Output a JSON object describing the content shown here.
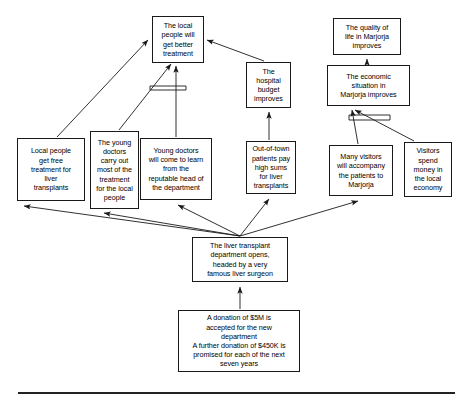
{
  "diagram": {
    "type": "causal-map",
    "baseline_rule": true,
    "nodes": [
      {
        "id": "local-people-better-treatment",
        "name": "node-local-people-better-treatment",
        "text": "The local\npeople will\nget better\ntreatment",
        "x": 152,
        "y": 16,
        "w": 52,
        "h": 47
      },
      {
        "id": "hospital-budget-improves",
        "name": "node-hospital-budget-improves",
        "text": "The\nhospital\nbudget\nimproves",
        "x": 246,
        "y": 62,
        "w": 45,
        "h": 46
      },
      {
        "id": "quality-of-life-marjorja",
        "name": "node-quality-of-life-marjorja",
        "text": "The quality of\nlife in Marjorja\nimproves",
        "x": 333,
        "y": 18,
        "w": 68,
        "h": 37
      },
      {
        "id": "economic-situation-marjorja",
        "name": "node-economic-situation-marjorja",
        "text": "The economic\nsituation in\nMarjorja improves",
        "x": 327,
        "y": 65,
        "w": 83,
        "h": 41
      },
      {
        "id": "local-people-free-treatment",
        "name": "node-local-people-free-treatment",
        "text": "Local people\nget free\ntreatment for\nliver\ntransplants",
        "x": 17,
        "y": 138,
        "w": 68,
        "h": 63
      },
      {
        "id": "young-doctors-carry-out",
        "name": "node-young-doctors-carry-out",
        "text": "The young\ndoctors\ncarry out\nmost of the\ntreatment\nfor the local\npeople",
        "x": 90,
        "y": 131,
        "w": 49,
        "h": 78
      },
      {
        "id": "young-doctors-come-learn",
        "name": "node-young-doctors-come-learn",
        "text": "Young doctors\nwill come to learn\nfrom the\nreputable head of\nthe department",
        "x": 140,
        "y": 138,
        "w": 72,
        "h": 62
      },
      {
        "id": "out-of-town-patients-pay",
        "name": "node-out-of-town-patients-pay",
        "text": "Out-of-town\npatients pay\nhigh sums\nfor liver\ntransplants",
        "x": 246,
        "y": 141,
        "w": 50,
        "h": 53
      },
      {
        "id": "many-visitors-accompany",
        "name": "node-many-visitors-accompany",
        "text": "Many visitors\nwill accompany\nthe patients to\nMarjorja",
        "x": 329,
        "y": 145,
        "w": 64,
        "h": 51
      },
      {
        "id": "visitors-spend-money",
        "name": "node-visitors-spend-money",
        "text": "Visitors\nspend\nmoney in\nthe local\neconomy",
        "x": 404,
        "y": 142,
        "w": 48,
        "h": 55
      },
      {
        "id": "liver-transplant-department-opens",
        "name": "node-liver-transplant-department-opens",
        "text": "The liver transplant\ndepartment opens,\nheaded by a very\nfamous liver surgeon",
        "x": 192,
        "y": 237,
        "w": 96,
        "h": 45
      },
      {
        "id": "donation-accepted",
        "name": "node-donation-accepted",
        "text": "A donation of $5M is\naccepted for the new\ndepartment\nA further donation of $450K is\npromised for each of the next\nseven years",
        "x": 178,
        "y": 310,
        "w": 122,
        "h": 62
      }
    ],
    "edges": [
      {
        "id": "e1",
        "name": "arrow-free-treatment-to-better-treatment",
        "from": "local-people-free-treatment",
        "to": "local-people-better-treatment",
        "path": "M 57 137 L 148 40"
      },
      {
        "id": "e2",
        "name": "arrow-young-doctors-carry-out-to-better-treatment",
        "from": "young-doctors-carry-out",
        "to": "local-people-better-treatment",
        "path": "M 119 130 L 171 64"
      },
      {
        "id": "e3",
        "name": "arrow-young-doctors-learn-to-better-treatment",
        "from": "young-doctors-come-learn",
        "to": "local-people-better-treatment",
        "path": "M 176 137 L 176 66"
      },
      {
        "id": "e4",
        "name": "arrow-hospital-budget-to-better-treatment",
        "from": "hospital-budget-improves",
        "to": "local-people-better-treatment",
        "path": "M 264 61 L 207 40"
      },
      {
        "id": "e5",
        "name": "arrow-out-of-town-patients-to-hospital-budget",
        "from": "out-of-town-patients-pay",
        "to": "hospital-budget-improves",
        "path": "M 269 140 L 269 112"
      },
      {
        "id": "e6",
        "name": "arrow-economic-situation-to-quality-of-life",
        "from": "economic-situation-marjorja",
        "to": "quality-of-life-marjorja",
        "path": "M 367 64 L 367 59"
      },
      {
        "id": "e7",
        "name": "arrow-many-visitors-to-economic-situation",
        "from": "many-visitors-accompany",
        "to": "economic-situation-marjorja",
        "path": "M 358 144 L 352 110"
      },
      {
        "id": "e8",
        "name": "arrow-visitors-spend-to-economic-situation",
        "from": "visitors-spend-money",
        "to": "economic-situation-marjorja",
        "path": "M 414 141 L 355 110"
      },
      {
        "id": "e9",
        "name": "arrow-department-to-free-treatment",
        "from": "liver-transplant-department-opens",
        "to": "local-people-free-treatment",
        "path": "M 240 236 L 24 206"
      },
      {
        "id": "e10",
        "name": "arrow-department-to-young-doctors-carry-out",
        "from": "liver-transplant-department-opens",
        "to": "young-doctors-carry-out",
        "path": "M 240 236 L 104 213"
      },
      {
        "id": "e11",
        "name": "arrow-department-to-young-doctors-learn",
        "from": "liver-transplant-department-opens",
        "to": "young-doctors-come-learn",
        "path": "M 240 236 L 178 205"
      },
      {
        "id": "e12",
        "name": "arrow-department-to-out-of-town-patients",
        "from": "liver-transplant-department-opens",
        "to": "out-of-town-patients-pay",
        "path": "M 240 236 L 269 199"
      },
      {
        "id": "e13",
        "name": "arrow-department-to-many-visitors",
        "from": "liver-transplant-department-opens",
        "to": "many-visitors-accompany",
        "path": "M 240 236 L 358 201"
      },
      {
        "id": "e14",
        "name": "arrow-donation-to-department",
        "from": "donation-accepted",
        "to": "liver-transplant-department-opens",
        "path": "M 240 309 L 240 287"
      }
    ],
    "conjunction_markers": [
      {
        "id": "cm1",
        "name": "conjunction-marker-better-treatment",
        "x1": 150,
        "y1": 90,
        "x2": 186,
        "y2": 90,
        "x3": 150,
        "y3": 86,
        "x4": 186,
        "y4": 86
      },
      {
        "id": "cm2",
        "name": "conjunction-marker-economic-situation",
        "x1": 349,
        "y1": 120,
        "x2": 390,
        "y2": 120,
        "x3": 349,
        "y3": 115,
        "x4": 390,
        "y4": 115
      }
    ]
  }
}
